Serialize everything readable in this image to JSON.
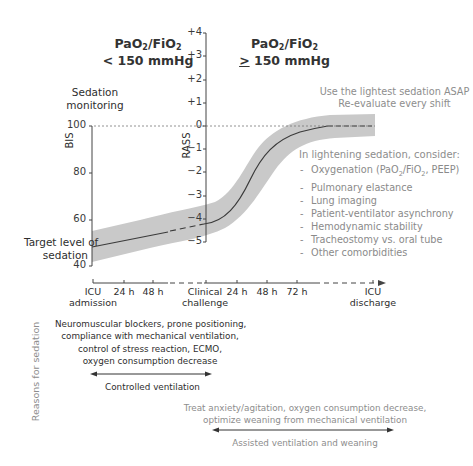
{
  "headers": {
    "left": {
      "line1_main": "PaO",
      "line1_sub1": "2",
      "line1_mid": "/FiO",
      "line1_sub2": "2",
      "line2": "< 150 mmHg"
    },
    "right": {
      "line1_main": "PaO",
      "line1_sub1": "2",
      "line1_mid": "/FiO",
      "line1_sub2": "2",
      "line2_sym": ">",
      "line2": " 150 mmHg"
    }
  },
  "sedation_monitoring": {
    "line1": "Sedation",
    "line2": "monitoring"
  },
  "lightest_note": {
    "line1": "Use the lightest sedation ASAP",
    "line2": "Re-evaluate every shift"
  },
  "bis_axis": {
    "label": "BIS",
    "ticks": [
      "100",
      "80",
      "60",
      "40"
    ]
  },
  "rass_axis": {
    "label": "RASS",
    "ticks": [
      "+4",
      "+3",
      "+2",
      "+1",
      "0",
      "−1",
      "−2",
      "−3",
      "−4",
      "−5"
    ]
  },
  "target_label": {
    "line1": "Target level of",
    "line2": "sedation"
  },
  "lightening": {
    "title": "In lightening sedation, consider:",
    "items": [
      {
        "pre": "Oxygenation (PaO",
        "sub1": "2",
        "mid": "/FiO",
        "sub2": "2",
        "post": ", PEEP)"
      },
      {
        "pre": "Pulmonary elastance"
      },
      {
        "pre": "Lung imaging"
      },
      {
        "pre": "Patient-ventilator asynchrony"
      },
      {
        "pre": "Hemodynamic stability"
      },
      {
        "pre": "Tracheostomy vs. oral tube"
      },
      {
        "pre": "Other comorbidities"
      }
    ]
  },
  "timeline": {
    "ticks": [
      {
        "line1": "ICU",
        "line2": "admission"
      },
      {
        "line1": "24 h"
      },
      {
        "line1": "48 h"
      },
      {
        "line1": "Clinical",
        "line2": "challenge"
      },
      {
        "line1": "24 h"
      },
      {
        "line1": "48 h"
      },
      {
        "line1": "72 h"
      },
      {
        "line1": "ICU",
        "line2": "discharge"
      }
    ]
  },
  "reasons_label": "Reasons for sedation",
  "controlled": {
    "reasons": [
      "Neuromuscular blockers, prone positioning,",
      "compliance with mechanical ventilation,",
      "control of stress reaction, ECMO,",
      "oxygen consumption decrease"
    ],
    "phase": "Controlled ventilation"
  },
  "assisted": {
    "reasons": [
      "Treat anxiety/agitation, oxygen consumption decrease,",
      "optimize weaning from mechanical ventilation"
    ],
    "phase": "Assisted ventilation and weaning"
  },
  "colors": {
    "band": "#c8c8c8",
    "curve": "#3a3a3a",
    "axis": "#444444",
    "grey_text": "#8d8d8d",
    "dark_text": "#2e2e2e"
  }
}
